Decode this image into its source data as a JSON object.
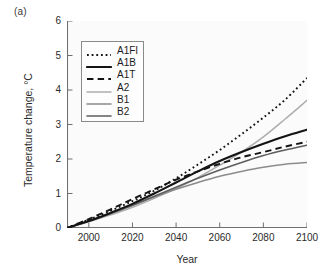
{
  "panel": {
    "label": "(a)"
  },
  "axes": {
    "ylabel": "Temperature change, °C",
    "xlabel": "Year",
    "yticks": [
      "0",
      "1",
      "2",
      "3",
      "4",
      "5",
      "6"
    ],
    "xticks": [
      "2000",
      "2020",
      "2040",
      "2060",
      "2080",
      "2100"
    ]
  },
  "legend": {
    "items": [
      {
        "label": "A1FI",
        "style": "dotted",
        "color": "#141414",
        "width": 1.9
      },
      {
        "label": "A1B",
        "style": "solid",
        "color": "#141414",
        "width": 2.1
      },
      {
        "label": "A1T",
        "style": "dashed",
        "color": "#141414",
        "width": 1.9
      },
      {
        "label": "A2",
        "style": "solid",
        "color": "#adadad",
        "width": 1.5
      },
      {
        "label": "B1",
        "style": "solid",
        "color": "#8c8c8c",
        "width": 1.6
      },
      {
        "label": "B2",
        "style": "solid",
        "color": "#5e5e5e",
        "width": 1.6
      }
    ]
  },
  "chart_data": {
    "type": "line",
    "title": "",
    "xlabel": "Year",
    "ylabel": "Temperature change, °C",
    "xlim": [
      1990,
      2100
    ],
    "ylim": [
      0,
      6
    ],
    "yticks": [
      0,
      1,
      2,
      3,
      4,
      5,
      6
    ],
    "xticks": [
      2000,
      2020,
      2040,
      2060,
      2080,
      2100
    ],
    "grid": false,
    "legend_position": "upper-left",
    "x": [
      1990,
      2000,
      2010,
      2020,
      2030,
      2040,
      2050,
      2060,
      2070,
      2080,
      2090,
      2100
    ],
    "series": [
      {
        "name": "A1FI",
        "style": "dotted",
        "color": "#141414",
        "values": [
          0.0,
          0.24,
          0.5,
          0.78,
          1.08,
          1.44,
          1.84,
          2.26,
          2.72,
          3.2,
          3.72,
          4.35
        ]
      },
      {
        "name": "A1B",
        "style": "solid",
        "color": "#141414",
        "values": [
          0.0,
          0.2,
          0.44,
          0.7,
          1.0,
          1.32,
          1.64,
          1.94,
          2.2,
          2.44,
          2.66,
          2.85
        ]
      },
      {
        "name": "A1T",
        "style": "dashed",
        "color": "#141414",
        "values": [
          0.0,
          0.26,
          0.54,
          0.84,
          1.12,
          1.4,
          1.64,
          1.86,
          2.05,
          2.2,
          2.36,
          2.5
        ]
      },
      {
        "name": "A2",
        "style": "solid",
        "color": "#adadad",
        "values": [
          0.0,
          0.18,
          0.38,
          0.6,
          0.86,
          1.14,
          1.46,
          1.82,
          2.2,
          2.64,
          3.16,
          3.7
        ]
      },
      {
        "name": "B1",
        "style": "solid",
        "color": "#8c8c8c",
        "values": [
          0.0,
          0.2,
          0.42,
          0.66,
          0.9,
          1.12,
          1.32,
          1.5,
          1.64,
          1.76,
          1.85,
          1.9
        ]
      },
      {
        "name": "B2",
        "style": "solid",
        "color": "#5e5e5e",
        "values": [
          0.0,
          0.2,
          0.42,
          0.66,
          0.92,
          1.18,
          1.44,
          1.68,
          1.9,
          2.1,
          2.26,
          2.4
        ]
      }
    ]
  }
}
